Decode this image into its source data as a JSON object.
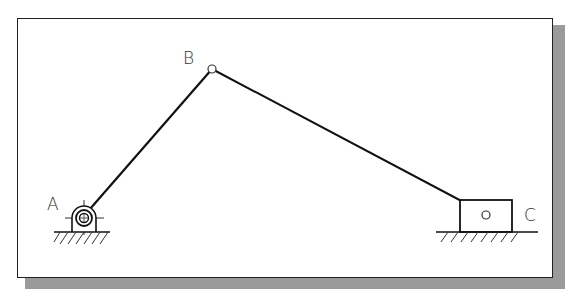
{
  "diagram": {
    "type": "slider-crank mechanism",
    "labels": {
      "joint_a": "A",
      "joint_b": "B",
      "joint_c": "C"
    },
    "nodes": [
      {
        "id": "A",
        "kind": "fixed pivot (ground support)",
        "x": 83,
        "y": 217
      },
      {
        "id": "B",
        "kind": "revolute joint",
        "x": 212,
        "y": 69
      },
      {
        "id": "C",
        "kind": "slider block on ground",
        "x": 486,
        "y": 214
      }
    ],
    "edges": [
      {
        "from": "A",
        "to": "B",
        "kind": "crank link"
      },
      {
        "from": "B",
        "to": "C",
        "kind": "connecting rod"
      }
    ],
    "colors": {
      "line": "#111111",
      "shadow": "#9a9a9a",
      "background": "#ffffff"
    }
  }
}
